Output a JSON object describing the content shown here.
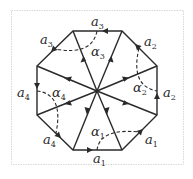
{
  "diagram": {
    "center": [
      97,
      91
    ],
    "vertices": [
      [
        73,
        31
      ],
      [
        122,
        31
      ],
      [
        157,
        66
      ],
      [
        157,
        115
      ],
      [
        122,
        150
      ],
      [
        73,
        150
      ],
      [
        37,
        115
      ],
      [
        37,
        66
      ]
    ],
    "edges": [
      {
        "label": "a",
        "sub": "3",
        "from": [
          122,
          31
        ],
        "to": [
          73,
          31
        ],
        "label_pos": [
          91,
          25
        ]
      },
      {
        "label": "a",
        "sub": "3",
        "from": [
          73,
          31
        ],
        "to": [
          37,
          66
        ],
        "label_pos": [
          40,
          42
        ]
      },
      {
        "label": "a",
        "sub": "4",
        "from": [
          37,
          66
        ],
        "to": [
          37,
          115
        ],
        "label_pos": [
          17,
          97
        ]
      },
      {
        "label": "a",
        "sub": "4",
        "from": [
          37,
          115
        ],
        "to": [
          73,
          150
        ],
        "label_pos": [
          43,
          145
        ]
      },
      {
        "label": "a",
        "sub": "1",
        "from": [
          73,
          150
        ],
        "to": [
          122,
          150
        ],
        "label_pos": [
          93,
          164
        ]
      },
      {
        "label": "a",
        "sub": "1",
        "from": [
          122,
          150
        ],
        "to": [
          157,
          115
        ],
        "label_pos": [
          145,
          145
        ]
      },
      {
        "label": "a",
        "sub": "2",
        "from": [
          157,
          115
        ],
        "to": [
          157,
          66
        ],
        "label_pos": [
          164,
          97
        ]
      },
      {
        "label": "a",
        "sub": "2",
        "from": [
          157,
          66
        ],
        "to": [
          122,
          31
        ],
        "label_pos": [
          145,
          47
        ]
      }
    ],
    "angles": [
      {
        "label": "α",
        "sub": "1",
        "label_pos": [
          91,
          137
        ]
      },
      {
        "label": "α",
        "sub": "2",
        "label_pos": [
          133,
          93
        ]
      },
      {
        "label": "α",
        "sub": "3",
        "label_pos": [
          91,
          55
        ]
      },
      {
        "label": "α",
        "sub": "4",
        "label_pos": [
          51,
          97
        ]
      }
    ],
    "edge_labels": {
      "e0": "a",
      "e0s": "3",
      "e1": "a",
      "e1s": "3",
      "e2": "a",
      "e2s": "4",
      "e3": "a",
      "e3s": "4",
      "e4": "a",
      "e4s": "1",
      "e5": "a",
      "e5s": "1",
      "e6": "a",
      "e6s": "2",
      "e7": "a",
      "e7s": "2"
    },
    "angle_labels": {
      "g1": "α",
      "g1s": "1",
      "g2": "α",
      "g2s": "2",
      "g3": "α",
      "g3s": "3",
      "g4": "α",
      "g4s": "4"
    },
    "stroke_color": "#2a2a2a",
    "frame_color": "#d8d8d8"
  }
}
